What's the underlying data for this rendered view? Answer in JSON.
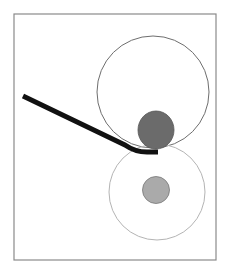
{
  "diagram": {
    "frame": {
      "x": 14,
      "y": 14,
      "width": 202,
      "height": 246,
      "stroke": "#8a8a8a"
    },
    "upper_roller": {
      "cx": 153,
      "cy": 92,
      "r": 56,
      "stroke": "#6e6e6e",
      "fill": "none"
    },
    "lower_roller": {
      "cx": 157,
      "cy": 192,
      "r": 48,
      "stroke": "#b4b4b4",
      "fill": "none"
    },
    "upper_hub": {
      "cx": 156,
      "cy": 130,
      "rx": 18,
      "ry": 19,
      "fill": "#6b6b6b",
      "stroke": "#555555"
    },
    "lower_hub": {
      "cx": 156,
      "cy": 190,
      "r": 13.5,
      "fill": "#aaaaaa",
      "stroke": "#777777"
    },
    "strip": {
      "path": "M 23 96 L 125 145 Q 135 152 147 152 L 158 152",
      "stroke": "#111111",
      "width": 5
    }
  }
}
